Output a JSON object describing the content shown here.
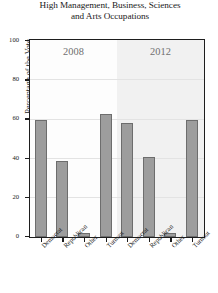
{
  "chart_data": {
    "type": "bar",
    "title": "High Management, Business, Sciences and Arts Occupations",
    "title_line1": "High Management, Business, Sciences",
    "title_line2": "and Arts Occupations",
    "xlabel": "",
    "ylabel": "Percentage of the Vote",
    "ylim": [
      0,
      100
    ],
    "yticks": [
      0,
      20,
      40,
      60,
      80,
      100
    ],
    "ytick_labels": [
      "0",
      "20",
      "40",
      "60",
      "80",
      "100"
    ],
    "grid": true,
    "grid_axis": "y",
    "legend": "none",
    "panels": [
      "2008",
      "2012"
    ],
    "categories": [
      "Democrat",
      "Republican",
      "Other",
      "Turnout"
    ],
    "series": [
      {
        "name": "2008",
        "values": [
          60,
          39,
          2,
          63
        ]
      },
      {
        "name": "2012",
        "values": [
          58,
          41,
          2,
          60
        ]
      }
    ],
    "bar_color": "#9d9d9d",
    "bar_edge_color": "#6d6d6d",
    "panel_bg_left": "#fdfdfd",
    "panel_bg_right": "#f1f1f1",
    "frame_color": "#1e1e1e",
    "grid_color": "#e3e3e3"
  }
}
